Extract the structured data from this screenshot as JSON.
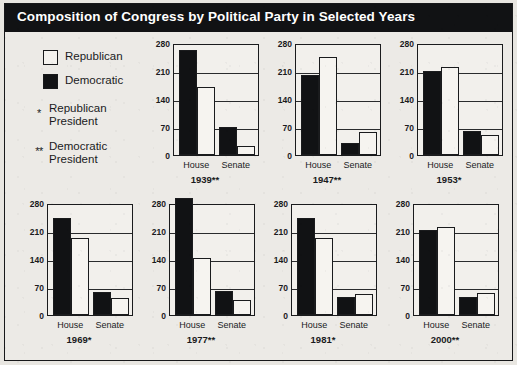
{
  "title": "Composition of Congress by Political Party in Selected Years",
  "legend": {
    "items": [
      {
        "key": "republican",
        "label": "Republican",
        "swatch": "open-square",
        "color": "#f4f2ee"
      },
      {
        "key": "democratic",
        "label": "Democratic",
        "swatch": "filled-square",
        "color": "#121315"
      }
    ],
    "notes": [
      {
        "marker": "*",
        "line1": "Republican",
        "line2": "President"
      },
      {
        "marker": "**",
        "line1": "Democratic",
        "line2": "President"
      }
    ]
  },
  "colors": {
    "title_bar": "#111214",
    "title_text": "#ffffff",
    "page_background": "#e8e6e1",
    "panel_background": "#f2f0ec",
    "axis": "#1a1b1d",
    "democratic": "#111214",
    "republican": "#f6f4f0"
  },
  "chart_data": {
    "type": "bar",
    "title": "Composition of Congress by Political Party in Selected Years",
    "xlabel": "",
    "ylabel": "",
    "ylim": [
      0,
      280
    ],
    "yticks": [
      0,
      70,
      140,
      210,
      280
    ],
    "grid": true,
    "legend_position": "left",
    "categories": [
      "House",
      "Senate"
    ],
    "series_names": [
      "Democratic",
      "Republican"
    ],
    "panels": [
      {
        "year": "1939",
        "president_marker": "**",
        "caption": "1939**",
        "president": "Democratic",
        "series": [
          {
            "name": "Democratic",
            "values": [
              262,
              69
            ]
          },
          {
            "name": "Republican",
            "values": [
              169,
              23
            ]
          }
        ]
      },
      {
        "year": "1947",
        "president_marker": "**",
        "caption": "1947**",
        "president": "Democratic",
        "series": [
          {
            "name": "Democratic",
            "values": [
              200,
              30
            ]
          },
          {
            "name": "Republican",
            "values": [
              246,
              57
            ]
          }
        ]
      },
      {
        "year": "1953",
        "president_marker": "*",
        "caption": "1953*",
        "president": "Republican",
        "series": [
          {
            "name": "Democratic",
            "values": [
              211,
              61
            ]
          },
          {
            "name": "Republican",
            "values": [
              219,
              50
            ]
          }
        ]
      },
      {
        "year": "1969",
        "president_marker": "*",
        "caption": "1969*",
        "president": "Republican",
        "series": [
          {
            "name": "Democratic",
            "values": [
              243,
              57
            ]
          },
          {
            "name": "Republican",
            "values": [
              192,
              43
            ]
          }
        ]
      },
      {
        "year": "1977",
        "president_marker": "**",
        "caption": "1977**",
        "president": "Democratic",
        "series": [
          {
            "name": "Democratic",
            "values": [
              292,
              61
            ]
          },
          {
            "name": "Republican",
            "values": [
              143,
              38
            ]
          }
        ]
      },
      {
        "year": "1981",
        "president_marker": "*",
        "caption": "1981*",
        "president": "Republican",
        "series": [
          {
            "name": "Democratic",
            "values": [
              243,
              46
            ]
          },
          {
            "name": "Republican",
            "values": [
              192,
              53
            ]
          }
        ]
      },
      {
        "year": "2000",
        "president_marker": "**",
        "caption": "2000**",
        "president": "Democratic",
        "series": [
          {
            "name": "Democratic",
            "values": [
              212,
              45
            ]
          },
          {
            "name": "Republican",
            "values": [
              221,
              55
            ]
          }
        ]
      }
    ]
  }
}
